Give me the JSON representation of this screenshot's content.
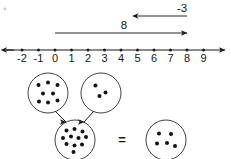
{
  "diagram": {
    "title": "Integer addition: 8 plus negative 3 equals 5",
    "equals_symbol": "=",
    "ink_color": "#1a1a1a",
    "background_color": "#ffffff"
  },
  "number_line": {
    "min": -2,
    "max": 9,
    "tick_labels": [
      "-2",
      "-1",
      "0",
      "1",
      "2",
      "3",
      "4",
      "5",
      "6",
      "7",
      "8",
      "9"
    ],
    "tick_values": [
      -2,
      -1,
      0,
      1,
      2,
      3,
      4,
      5,
      6,
      7,
      8,
      9
    ],
    "left_arrow": true,
    "right_arrow": true,
    "y_px": 50,
    "x_at_min_px": 22,
    "px_per_unit": 16.5
  },
  "jumps": [
    {
      "name": "first-jump",
      "label": "8",
      "value": 8,
      "from": 0,
      "to": 8,
      "direction": "right",
      "y_px": 33,
      "label_x_px": 124,
      "label_y_px": 29
    },
    {
      "name": "second-jump",
      "label": "-3",
      "value": -3,
      "from": 8,
      "to": 5,
      "direction": "left",
      "y_px": 16,
      "label_x_px": 182,
      "label_y_px": 12
    }
  ],
  "counter_model": {
    "groups": [
      {
        "name": "positive-group",
        "dot_count": 8,
        "sign": "positive",
        "cx": 48,
        "cy": 93,
        "r": 20,
        "dots": [
          [
            -9.5,
            -8.0
          ],
          [
            0.0,
            -10.5
          ],
          [
            9.5,
            -8.0
          ],
          [
            -5.0,
            0.5
          ],
          [
            5.0,
            0.5
          ],
          [
            -9.0,
            8.5
          ],
          [
            0.0,
            9.5
          ],
          [
            9.5,
            7.5
          ]
        ]
      },
      {
        "name": "negative-group",
        "dot_count": 3,
        "sign": "negative",
        "cx": 101,
        "cy": 93,
        "r": 20,
        "dots": [
          [
            -5.5,
            -7.5
          ],
          [
            4.5,
            -0.5
          ],
          [
            -1.5,
            3.0
          ]
        ]
      },
      {
        "name": "combined-group",
        "dot_count": 11,
        "sign": "mixed",
        "cx": 75,
        "cy": 140,
        "r": 20,
        "dots": [
          [
            -8.5,
            -9.5
          ],
          [
            -0.5,
            -11.0
          ],
          [
            7.5,
            -8.5
          ],
          [
            -12.0,
            -2.0
          ],
          [
            -4.0,
            -3.5
          ],
          [
            3.5,
            -2.0
          ],
          [
            11.0,
            -3.0
          ],
          [
            -8.5,
            4.0
          ],
          [
            -0.5,
            5.5
          ],
          [
            7.0,
            4.5
          ],
          [
            -1.5,
            12.0
          ]
        ]
      },
      {
        "name": "result-group",
        "dot_count": 5,
        "sign": "positive",
        "cx": 166,
        "cy": 140,
        "r": 20,
        "dots": [
          [
            -7.0,
            -6.5
          ],
          [
            5.0,
            -6.0
          ],
          [
            -9.0,
            3.5
          ],
          [
            1.0,
            3.0
          ],
          [
            9.0,
            6.0
          ]
        ]
      }
    ],
    "arrows": [
      {
        "name": "arrow-from-positive",
        "x1": 55,
        "y1": 111,
        "x2": 66,
        "y2": 122
      },
      {
        "name": "arrow-from-negative",
        "x1": 94,
        "y1": 111,
        "x2": 84,
        "y2": 122
      }
    ],
    "equals_x": 122,
    "equals_y": 144
  }
}
